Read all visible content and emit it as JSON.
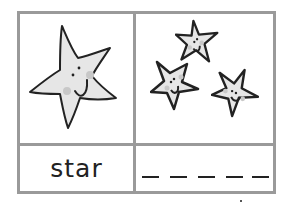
{
  "card": {
    "word": "star",
    "picture_single": "star-icon",
    "picture_group": [
      "star-icon",
      "star-icon",
      "star-icon"
    ],
    "blank_dashes": 5
  },
  "colors": {
    "border": "#9a9a9a",
    "star_fill": "#e6e6e6",
    "cheek": "#c8c8c8",
    "ink": "#222222"
  }
}
